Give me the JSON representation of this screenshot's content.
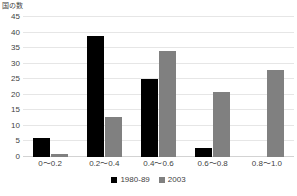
{
  "chart_data": {
    "type": "bar",
    "title": "",
    "subtitle": "",
    "ylabel": "国の数",
    "xlabel": "",
    "categories": [
      "0〜0.2",
      "0.2〜0.4",
      "0.4〜0.6",
      "0.6〜0.8",
      "0.8〜1.0"
    ],
    "series": [
      {
        "name": "1980-89",
        "color": "#000000",
        "values": [
          6,
          39,
          25,
          3,
          0
        ]
      },
      {
        "name": "2003",
        "color": "#808080",
        "values": [
          1,
          13,
          34,
          21,
          28
        ]
      }
    ],
    "ylim": [
      0,
      45
    ],
    "ytick_labels": [
      "0",
      "5",
      "10",
      "15",
      "20",
      "25",
      "30",
      "35",
      "40",
      "45"
    ],
    "ytick_values": [
      0,
      5,
      10,
      15,
      20,
      25,
      30,
      35,
      40,
      45
    ],
    "ytick_step": 5,
    "grid": true,
    "legend_position": "bottom",
    "legend_entries": [
      "1980-89",
      "2003"
    ]
  },
  "colors": {
    "series_1980_89": "#000000",
    "series_2003": "#808080",
    "gridline": "#e6e6e6",
    "text": "#3f3f3f",
    "background": "#ffffff"
  }
}
